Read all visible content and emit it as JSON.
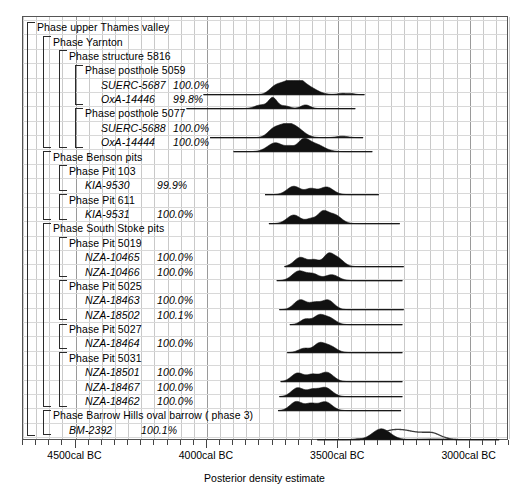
{
  "chart_data": {
    "type": "area",
    "title": "",
    "xlabel": "Posterior density estimate",
    "ylabel": "",
    "xlim": [
      -4700,
      -2850
    ],
    "x_tick_labels": [
      "4500cal BC",
      "4000cal BC",
      "3500cal BC",
      "3000cal BC"
    ],
    "x_tick_values": [
      -4500,
      -4000,
      -3500,
      -3000
    ],
    "grid": true,
    "legend": "none",
    "note": "OxCal multiplot: each sample row shows a posterior probability density distribution (filled black) over a calibrated-date range line; BM-2392 also shows an unfilled prior/likelihood outline.",
    "rows": [
      {
        "kind": "phase",
        "depth": 0,
        "label": "Phase upper Thames valley",
        "dist": null
      },
      {
        "kind": "phase",
        "depth": 1,
        "label": "Phase Yarnton",
        "dist": null
      },
      {
        "kind": "phase",
        "depth": 2,
        "label": "Phase structure 5816",
        "dist": null
      },
      {
        "kind": "phase",
        "depth": 3,
        "label": "Phase posthole 5059",
        "dist": null
      },
      {
        "kind": "sample",
        "depth": 4,
        "label": "SUERC-5687",
        "agreement": "100.0%",
        "range": [
          -4010,
          -3395
        ],
        "peaks": [
          {
            "c": -3740,
            "h": 0.42,
            "w": 22
          },
          {
            "c": -3700,
            "h": 0.78,
            "w": 30
          },
          {
            "c": -3655,
            "h": 0.95,
            "w": 26
          },
          {
            "c": -3610,
            "h": 0.58,
            "w": 34
          },
          {
            "c": -3480,
            "h": 0.1,
            "w": 18
          },
          {
            "c": -3445,
            "h": 0.08,
            "w": 14
          }
        ]
      },
      {
        "kind": "sample",
        "depth": 4,
        "label": "OxA-14446",
        "agreement": "99.8%",
        "range": [
          -4075,
          -3430
        ],
        "peaks": [
          {
            "c": -3790,
            "h": 0.3,
            "w": 24
          },
          {
            "c": -3745,
            "h": 0.85,
            "w": 16
          },
          {
            "c": -3700,
            "h": 0.22,
            "w": 20
          },
          {
            "c": -3620,
            "h": 0.3,
            "w": 18
          }
        ]
      },
      {
        "kind": "phase",
        "depth": 3,
        "label": "Phase posthole 5077",
        "dist": null
      },
      {
        "kind": "sample",
        "depth": 4,
        "label": "SUERC-5688",
        "agreement": "100.0%",
        "range": [
          -3985,
          -3400
        ],
        "peaks": [
          {
            "c": -3745,
            "h": 0.55,
            "w": 22
          },
          {
            "c": -3700,
            "h": 0.88,
            "w": 28
          },
          {
            "c": -3655,
            "h": 0.7,
            "w": 30
          },
          {
            "c": -3480,
            "h": 0.12,
            "w": 22
          }
        ]
      },
      {
        "kind": "sample",
        "depth": 4,
        "label": "OxA-14444",
        "agreement": "100.0%",
        "range": [
          -3895,
          -3365
        ],
        "peaks": [
          {
            "c": -3735,
            "h": 0.72,
            "w": 30
          },
          {
            "c": -3680,
            "h": 0.3,
            "w": 16
          },
          {
            "c": -3630,
            "h": 0.8,
            "w": 22
          },
          {
            "c": -3585,
            "h": 0.62,
            "w": 34
          }
        ]
      },
      {
        "kind": "phase",
        "depth": 1,
        "label": "Phase Benson pits",
        "dist": null
      },
      {
        "kind": "phase",
        "depth": 2,
        "label": "Phase Pit 103",
        "dist": null
      },
      {
        "kind": "sample",
        "depth": 3,
        "label": "KIA-9530",
        "agreement": "99.9%",
        "range": [
          -3775,
          -3340
        ],
        "peaks": [
          {
            "c": -3665,
            "h": 0.68,
            "w": 26
          },
          {
            "c": -3600,
            "h": 0.45,
            "w": 20
          },
          {
            "c": -3540,
            "h": 0.62,
            "w": 26
          }
        ]
      },
      {
        "kind": "phase",
        "depth": 2,
        "label": "Phase Pit 611",
        "dist": null
      },
      {
        "kind": "sample",
        "depth": 3,
        "label": "KIA-9531",
        "agreement": "100.0%",
        "range": [
          -3760,
          -3260
        ],
        "peaks": [
          {
            "c": -3665,
            "h": 0.7,
            "w": 26
          },
          {
            "c": -3600,
            "h": 0.35,
            "w": 18
          },
          {
            "c": -3555,
            "h": 0.88,
            "w": 20
          },
          {
            "c": -3510,
            "h": 0.72,
            "w": 26
          }
        ]
      },
      {
        "kind": "phase",
        "depth": 1,
        "label": "Phase South Stoke pits",
        "dist": null
      },
      {
        "kind": "phase",
        "depth": 2,
        "label": "Phase Pit 5019",
        "dist": null
      },
      {
        "kind": "sample",
        "depth": 3,
        "label": "NZA-10465",
        "agreement": "100.0%",
        "range": [
          -3700,
          -3245
        ],
        "peaks": [
          {
            "c": -3640,
            "h": 0.75,
            "w": 24
          },
          {
            "c": -3585,
            "h": 0.52,
            "w": 20
          },
          {
            "c": -3535,
            "h": 0.82,
            "w": 18
          },
          {
            "c": -3500,
            "h": 0.72,
            "w": 24
          }
        ]
      },
      {
        "kind": "sample",
        "depth": 3,
        "label": "NZA-10466",
        "agreement": "100.0%",
        "range": [
          -3730,
          -3250
        ],
        "peaks": [
          {
            "c": -3645,
            "h": 0.78,
            "w": 26
          },
          {
            "c": -3590,
            "h": 0.5,
            "w": 22
          },
          {
            "c": -3520,
            "h": 0.48,
            "w": 26
          }
        ]
      },
      {
        "kind": "phase",
        "depth": 2,
        "label": "Phase Pit 5025",
        "dist": null
      },
      {
        "kind": "sample",
        "depth": 3,
        "label": "NZA-18463",
        "agreement": "100.0%",
        "range": [
          -3720,
          -3245
        ],
        "peaks": [
          {
            "c": -3640,
            "h": 0.8,
            "w": 24
          },
          {
            "c": -3585,
            "h": 0.5,
            "w": 20
          },
          {
            "c": -3535,
            "h": 0.78,
            "w": 24
          }
        ]
      },
      {
        "kind": "sample",
        "depth": 3,
        "label": "NZA-18502",
        "agreement": "100.1%",
        "range": [
          -3680,
          -3250
        ],
        "peaks": [
          {
            "c": -3620,
            "h": 0.45,
            "w": 20
          },
          {
            "c": -3570,
            "h": 0.66,
            "w": 20
          },
          {
            "c": -3530,
            "h": 0.55,
            "w": 24
          }
        ]
      },
      {
        "kind": "phase",
        "depth": 2,
        "label": "Phase Pit 5027",
        "dist": null
      },
      {
        "kind": "sample",
        "depth": 3,
        "label": "NZA-18464",
        "agreement": "100.0%",
        "range": [
          -3690,
          -3250
        ],
        "peaks": [
          {
            "c": -3625,
            "h": 0.35,
            "w": 22
          },
          {
            "c": -3570,
            "h": 0.62,
            "w": 20
          },
          {
            "c": -3530,
            "h": 0.56,
            "w": 26
          }
        ]
      },
      {
        "kind": "phase",
        "depth": 2,
        "label": "Phase Pit 5031",
        "dist": null
      },
      {
        "kind": "sample",
        "depth": 3,
        "label": "NZA-18501",
        "agreement": "100.0%",
        "range": [
          -3715,
          -3250
        ],
        "peaks": [
          {
            "c": -3650,
            "h": 0.7,
            "w": 24
          },
          {
            "c": -3595,
            "h": 0.5,
            "w": 20
          },
          {
            "c": -3540,
            "h": 0.76,
            "w": 26
          }
        ]
      },
      {
        "kind": "sample",
        "depth": 3,
        "label": "NZA-18467",
        "agreement": "100.0%",
        "range": [
          -3720,
          -3250
        ],
        "peaks": [
          {
            "c": -3650,
            "h": 0.72,
            "w": 24
          },
          {
            "c": -3595,
            "h": 0.48,
            "w": 20
          },
          {
            "c": -3545,
            "h": 0.74,
            "w": 26
          }
        ]
      },
      {
        "kind": "sample",
        "depth": 3,
        "label": "NZA-18462",
        "agreement": "100.0%",
        "range": [
          -3725,
          -3255
        ],
        "peaks": [
          {
            "c": -3655,
            "h": 0.74,
            "w": 24
          },
          {
            "c": -3600,
            "h": 0.5,
            "w": 20
          },
          {
            "c": -3545,
            "h": 0.72,
            "w": 26
          }
        ]
      },
      {
        "kind": "phase",
        "depth": 1,
        "label": "Phase Barrow Hills oval barrow  ( phase 3)",
        "dist": null
      },
      {
        "kind": "sample",
        "depth": 2,
        "label": "BM-2392",
        "agreement": "100.1%",
        "range": [
          -3575,
          -2880
        ],
        "peaks": [
          {
            "c": -3425,
            "h": 0.05,
            "w": 14
          },
          {
            "c": -3330,
            "h": 0.88,
            "w": 34
          },
          {
            "c": -3130,
            "h": 0.06,
            "w": 60
          }
        ],
        "outline": [
          {
            "c": -3300,
            "h": 0.62,
            "w": 40
          },
          {
            "c": -3230,
            "h": 0.6,
            "w": 40
          },
          {
            "c": -3170,
            "h": 0.3,
            "w": 26
          },
          {
            "c": -3130,
            "h": 0.42,
            "w": 24
          },
          {
            "c": -3090,
            "h": 0.1,
            "w": 20
          }
        ]
      }
    ]
  }
}
